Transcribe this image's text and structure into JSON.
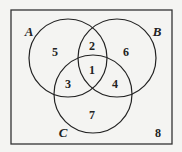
{
  "diagram": {
    "type": "venn",
    "universe_label": "8",
    "sets": [
      {
        "name": "A",
        "cx": 68,
        "cy": 58,
        "r": 39,
        "label_x": 29,
        "label_y": 36
      },
      {
        "name": "B",
        "cx": 117,
        "cy": 58,
        "r": 39,
        "label_x": 157,
        "label_y": 36
      },
      {
        "name": "C",
        "cx": 93,
        "cy": 94,
        "r": 39,
        "label_x": 63,
        "label_y": 137
      }
    ],
    "regions": [
      {
        "id": "1",
        "label": "1",
        "x": 92,
        "y": 74,
        "membership": "A∩B∩C"
      },
      {
        "id": "2",
        "label": "2",
        "x": 92,
        "y": 50,
        "membership": "A∩B only"
      },
      {
        "id": "3",
        "label": "3",
        "x": 68,
        "y": 88,
        "membership": "A∩C only"
      },
      {
        "id": "4",
        "label": "4",
        "x": 115,
        "y": 88,
        "membership": "B∩C only"
      },
      {
        "id": "5",
        "label": "5",
        "x": 55,
        "y": 56,
        "membership": "A only"
      },
      {
        "id": "6",
        "label": "6",
        "x": 126,
        "y": 56,
        "membership": "B only"
      },
      {
        "id": "7",
        "label": "7",
        "x": 92,
        "y": 119,
        "membership": "C only"
      },
      {
        "id": "8",
        "label": "8",
        "x": 158,
        "y": 137,
        "membership": "outside all"
      }
    ]
  }
}
